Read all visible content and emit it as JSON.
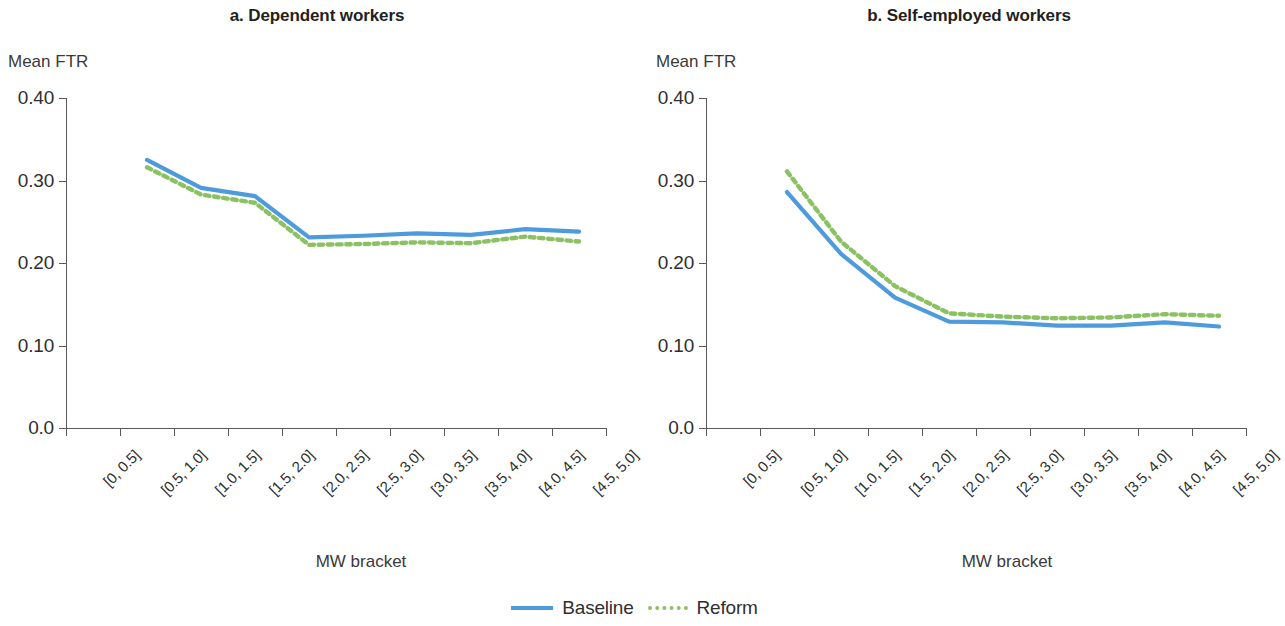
{
  "figure": {
    "legend": {
      "items": [
        {
          "label": "Baseline",
          "style": "solid",
          "color": "#4d9bdc"
        },
        {
          "label": "Reform",
          "style": "dotted",
          "color": "#8cc163"
        }
      ]
    }
  },
  "panels": [
    {
      "id": "a",
      "title": "a. Dependent workers",
      "ylabel": "Mean FTR",
      "xlabel": "MW bracket"
    },
    {
      "id": "b",
      "title": "b. Self-employed workers",
      "ylabel": "Mean FTR",
      "xlabel": "MW bracket"
    }
  ],
  "chart_data": [
    {
      "type": "line",
      "title": "a. Dependent workers",
      "xlabel": "MW bracket",
      "ylabel": "Mean FTR",
      "categories": [
        "[0, 0.5]",
        "[0.5, 1.0]",
        "[1.0, 1.5]",
        "[1.5, 2.0]",
        "[2.0, 2.5]",
        "[2.5, 3.0]",
        "[3.0, 3.5]",
        "[3.5, 4.0]",
        "[4.0, 4.5]",
        "[4.5, 5.0]"
      ],
      "ylim": [
        0.0,
        0.4
      ],
      "yticks": [
        0.0,
        0.1,
        0.2,
        0.3,
        0.4
      ],
      "ytick_labels": [
        "0.0",
        "0.10",
        "0.20",
        "0.30",
        "0.40"
      ],
      "grid": false,
      "legend_position": "bottom",
      "series": [
        {
          "name": "Baseline",
          "color": "#4d9bdc",
          "style": "solid",
          "values": [
            null,
            0.325,
            0.291,
            0.281,
            0.231,
            0.233,
            0.236,
            0.234,
            0.241,
            0.238
          ]
        },
        {
          "name": "Reform",
          "color": "#8cc163",
          "style": "dotted",
          "values": [
            null,
            0.316,
            0.283,
            0.273,
            0.222,
            0.223,
            0.225,
            0.224,
            0.232,
            0.226
          ]
        }
      ]
    },
    {
      "type": "line",
      "title": "b. Self-employed workers",
      "xlabel": "MW bracket",
      "ylabel": "Mean FTR",
      "categories": [
        "[0, 0.5]",
        "[0.5, 1.0]",
        "[1.0, 1.5]",
        "[1.5, 2.0]",
        "[2.0, 2.5]",
        "[2.5, 3.0]",
        "[3.0, 3.5]",
        "[3.5, 4.0]",
        "[4.0, 4.5]",
        "[4.5, 5.0]"
      ],
      "ylim": [
        0.0,
        0.4
      ],
      "yticks": [
        0.0,
        0.1,
        0.2,
        0.3,
        0.4
      ],
      "ytick_labels": [
        "0.0",
        "0.10",
        "0.20",
        "0.30",
        "0.40"
      ],
      "grid": false,
      "legend_position": "bottom",
      "series": [
        {
          "name": "Baseline",
          "color": "#4d9bdc",
          "style": "solid",
          "values": [
            null,
            0.286,
            0.211,
            0.158,
            0.129,
            0.128,
            0.124,
            0.124,
            0.128,
            0.123
          ]
        },
        {
          "name": "Reform",
          "color": "#8cc163",
          "style": "dotted",
          "values": [
            null,
            0.311,
            0.226,
            0.172,
            0.139,
            0.135,
            0.133,
            0.134,
            0.138,
            0.136
          ]
        }
      ]
    }
  ]
}
